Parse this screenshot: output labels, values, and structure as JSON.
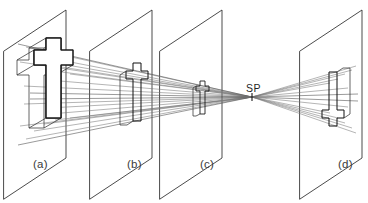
{
  "figure": {
    "background_color": "#ffffff",
    "line_color": "#1a1a1a",
    "ray_color": "#777777",
    "shade_color": "#9a9a9a",
    "width": 368,
    "height": 203
  },
  "station_point": {
    "label": "SP",
    "meaning": "station point",
    "x": 252,
    "y": 97
  },
  "planes": [
    {
      "id": "a",
      "label": "(a)",
      "role": "object-plane",
      "content": "three-dimensional cross-shaped solid",
      "top_right_x": 66,
      "bottom_left_x": 4
    },
    {
      "id": "b",
      "label": "(b)",
      "role": "picture-plane",
      "content": "projected cross outline, upright, medium",
      "top_right_x": 152,
      "bottom_left_x": 90
    },
    {
      "id": "c",
      "label": "(c)",
      "role": "picture-plane",
      "content": "projected cross outline, upright, small",
      "top_right_x": 222,
      "bottom_left_x": 160
    },
    {
      "id": "d",
      "label": "(d)",
      "role": "picture-plane",
      "content": "projected cross outline, inverted, beyond station point",
      "top_right_x": 362,
      "bottom_left_x": 300
    }
  ],
  "labels": {
    "a": "(a)",
    "b": "(b)",
    "c": "(c)",
    "d": "(d)",
    "sp": "SP"
  }
}
